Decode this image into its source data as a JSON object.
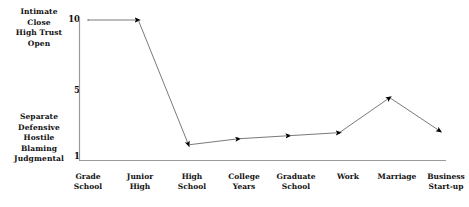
{
  "chart_data": {
    "type": "line",
    "title": "",
    "subtitle": "",
    "xlabel": "",
    "ylabel": "",
    "categories": [
      "Grade School",
      "Junior High",
      "High School",
      "College Years",
      "Graduate School",
      "Work",
      "Marriage",
      "Business Start-up"
    ],
    "category_lines": [
      [
        "Grade",
        "School"
      ],
      [
        "Junior",
        "High"
      ],
      [
        "High",
        "School"
      ],
      [
        "College",
        "Years"
      ],
      [
        "Graduate",
        "School"
      ],
      [
        "Work",
        ""
      ],
      [
        "Marriage",
        ""
      ],
      [
        "Business",
        "Start-up"
      ]
    ],
    "values": [
      10,
      10,
      1.8,
      2.2,
      2.4,
      2.6,
      4.9,
      2.7
    ],
    "ylim": [
      1,
      10
    ],
    "xlim": [
      0,
      7
    ],
    "yticks": [
      1,
      5,
      10
    ],
    "ytick_labels": [
      "1",
      "5",
      "10"
    ],
    "grid": false,
    "legend": false,
    "marker": "arrowhead",
    "line_color": "#7a7a7a",
    "marker_color": "#000000",
    "axis_color": "#9a9a9a",
    "series": [
      {
        "name": "Communication quality",
        "values": [
          10,
          10,
          1.8,
          2.2,
          2.4,
          2.6,
          4.9,
          2.7
        ]
      }
    ],
    "annotations": {
      "y_high_descriptor": [
        "Intimate",
        "Close",
        "High Trust",
        "Open"
      ],
      "y_low_descriptor": [
        "Separate",
        "Defensive",
        "Hostile",
        "Blaming",
        "Judgmental"
      ]
    }
  },
  "axis": {
    "high_labels": [
      "Intimate",
      "Close",
      "High Trust",
      "Open"
    ],
    "low_labels": [
      "Separate",
      "Defensive",
      "Hostile",
      "Blaming",
      "Judgmental"
    ],
    "ytick_10": "10",
    "ytick_5": "5",
    "ytick_1": "1"
  },
  "xlabels": [
    {
      "line1": "Grade",
      "line2": "School"
    },
    {
      "line1": "Junior",
      "line2": "High"
    },
    {
      "line1": "High",
      "line2": "School"
    },
    {
      "line1": "College",
      "line2": "Years"
    },
    {
      "line1": "Graduate",
      "line2": "School"
    },
    {
      "line1": "Work",
      "line2": ""
    },
    {
      "line1": "Marriage",
      "line2": ""
    },
    {
      "line1": "Business",
      "line2": "Start-up"
    }
  ],
  "colors": {
    "line": "#7a7a7a",
    "marker": "#000000",
    "axis": "#9a9a9a",
    "text": "#111111",
    "background": "#ffffff"
  }
}
